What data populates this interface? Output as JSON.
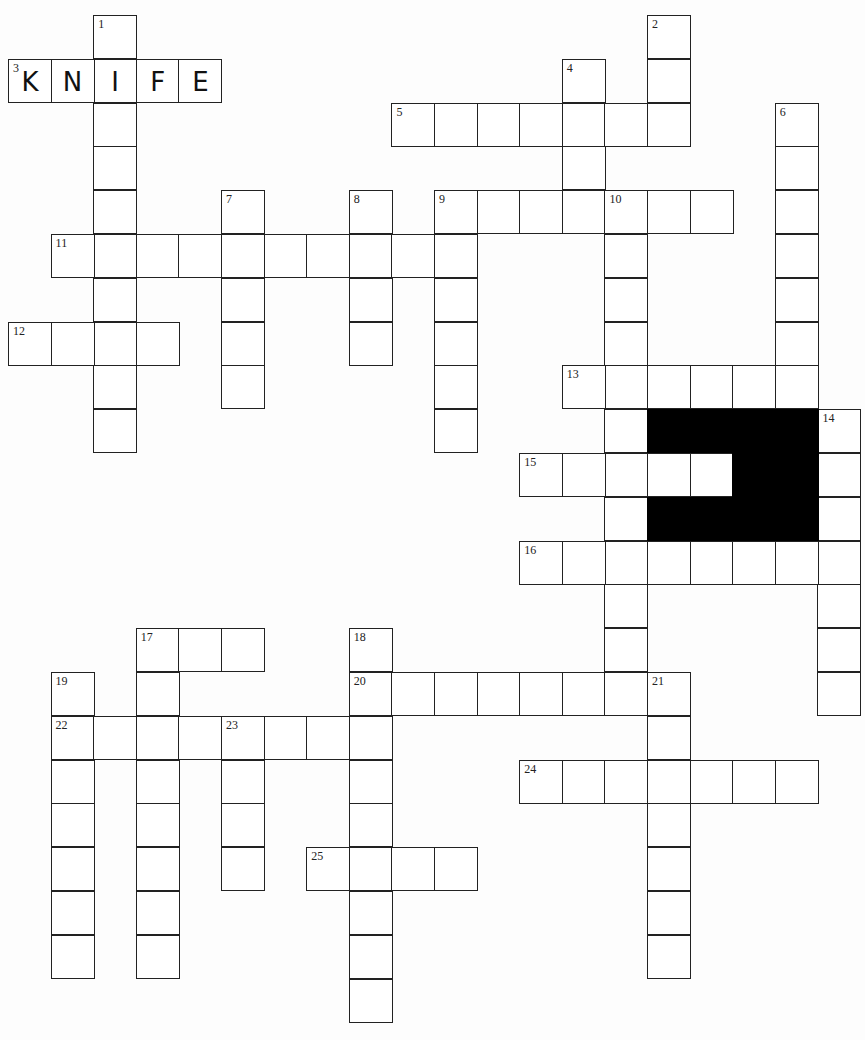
{
  "puzzle": {
    "type": "crossword",
    "cell_size": 43,
    "origin": {
      "x": 8,
      "y": 15
    },
    "pitch": {
      "x": 42.6,
      "y": 43.8
    },
    "entries": [
      {
        "num": "1",
        "dir": "down",
        "row": 0,
        "col": 2,
        "length": 10
      },
      {
        "num": "2",
        "dir": "down",
        "row": 0,
        "col": 15,
        "length": 3
      },
      {
        "num": "3",
        "dir": "across",
        "row": 1,
        "col": 0,
        "length": 5,
        "answer": "KNIFE"
      },
      {
        "num": "4",
        "dir": "down",
        "row": 1,
        "col": 13,
        "length": 3
      },
      {
        "num": "5",
        "dir": "across",
        "row": 2,
        "col": 9,
        "length": 7
      },
      {
        "num": "6",
        "dir": "down",
        "row": 2,
        "col": 18,
        "length": 6
      },
      {
        "num": "7",
        "dir": "down",
        "row": 4,
        "col": 5,
        "length": 5
      },
      {
        "num": "8",
        "dir": "down",
        "row": 4,
        "col": 8,
        "length": 4
      },
      {
        "num": "9",
        "dir": "across",
        "row": 4,
        "col": 10,
        "length": 7
      },
      {
        "num": "9",
        "dir": "down",
        "row": 4,
        "col": 10,
        "length": 6
      },
      {
        "num": "10",
        "dir": "down",
        "row": 4,
        "col": 14,
        "length": 11
      },
      {
        "num": "11",
        "dir": "across",
        "row": 5,
        "col": 1,
        "length": 10
      },
      {
        "num": "12",
        "dir": "across",
        "row": 7,
        "col": 0,
        "length": 4
      },
      {
        "num": "13",
        "dir": "across",
        "row": 8,
        "col": 13,
        "length": 6
      },
      {
        "num": "14",
        "dir": "down",
        "row": 9,
        "col": 19,
        "length": 7
      },
      {
        "num": "15",
        "dir": "across",
        "row": 10,
        "col": 12,
        "length": 5
      },
      {
        "num": "16",
        "dir": "across",
        "row": 12,
        "col": 12,
        "length": 8
      },
      {
        "num": "17",
        "dir": "across",
        "row": 14,
        "col": 3,
        "length": 3
      },
      {
        "num": "17",
        "dir": "down",
        "row": 14,
        "col": 3,
        "length": 8
      },
      {
        "num": "18",
        "dir": "down",
        "row": 14,
        "col": 8,
        "length": 9
      },
      {
        "num": "19",
        "dir": "down",
        "row": 15,
        "col": 1,
        "length": 7
      },
      {
        "num": "20",
        "dir": "across",
        "row": 15,
        "col": 8,
        "length": 8
      },
      {
        "num": "21",
        "dir": "down",
        "row": 15,
        "col": 15,
        "length": 7
      },
      {
        "num": "22",
        "dir": "across",
        "row": 16,
        "col": 1,
        "length": 8
      },
      {
        "num": "23",
        "dir": "down",
        "row": 16,
        "col": 5,
        "length": 4
      },
      {
        "num": "24",
        "dir": "across",
        "row": 17,
        "col": 12,
        "length": 7
      },
      {
        "num": "25",
        "dir": "across",
        "row": 19,
        "col": 7,
        "length": 4
      }
    ],
    "black_cells": [
      [
        9,
        15
      ],
      [
        9,
        16
      ],
      [
        9,
        17
      ],
      [
        9,
        18
      ],
      [
        10,
        17
      ],
      [
        10,
        18
      ],
      [
        11,
        15
      ],
      [
        11,
        16
      ],
      [
        11,
        17
      ],
      [
        11,
        18
      ]
    ],
    "white_inside_black": [
      [
        10,
        15
      ],
      [
        10,
        16
      ]
    ],
    "filled_answer": {
      "entry": "3-across",
      "letters": [
        "K",
        "N",
        "I",
        "F",
        "E"
      ]
    }
  }
}
